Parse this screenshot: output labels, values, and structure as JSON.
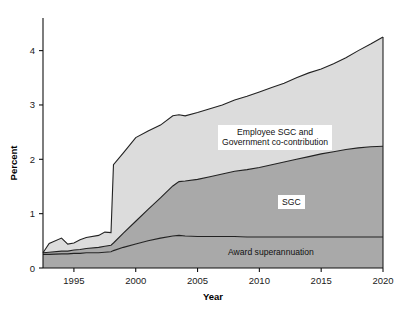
{
  "chart_data": {
    "type": "area",
    "title": "",
    "xlabel": "Year",
    "ylabel": "Percent",
    "xlim": [
      1992.5,
      2020
    ],
    "ylim": [
      0,
      4.6
    ],
    "xticks": [
      1995,
      2000,
      2005,
      2010,
      2015,
      2020
    ],
    "yticks": [
      0,
      1,
      2,
      3,
      4
    ],
    "xtick_labels": [
      "1995",
      "2000",
      "2005",
      "2010",
      "2015",
      "2020"
    ],
    "ytick_labels": [
      "0",
      "1",
      "2",
      "3",
      "4"
    ],
    "grid": false,
    "legend_position": "inline-annotations",
    "stacked": true,
    "x": [
      1992.5,
      1993,
      1994,
      1994.5,
      1995,
      1995.5,
      1996,
      1997,
      1997.5,
      1998,
      1998.2,
      1999,
      2000,
      2001,
      2002,
      2003,
      2003.5,
      2004,
      2005,
      2006,
      2007,
      2008,
      2009,
      2010,
      2011,
      2012,
      2013,
      2014,
      2015,
      2016,
      2017,
      2018,
      2019,
      2020
    ],
    "series": [
      {
        "name": "Award superannuation",
        "color": "#a9a9a9",
        "values": [
          0.25,
          0.25,
          0.26,
          0.26,
          0.27,
          0.27,
          0.28,
          0.28,
          0.29,
          0.3,
          0.32,
          0.38,
          0.44,
          0.5,
          0.55,
          0.59,
          0.6,
          0.59,
          0.58,
          0.58,
          0.58,
          0.58,
          0.57,
          0.57,
          0.57,
          0.57,
          0.57,
          0.57,
          0.57,
          0.57,
          0.57,
          0.57,
          0.57,
          0.57
        ]
      },
      {
        "name": "SGC",
        "color": "#a9a9a9",
        "values": [
          0.03,
          0.04,
          0.05,
          0.05,
          0.06,
          0.07,
          0.08,
          0.1,
          0.11,
          0.12,
          0.14,
          0.26,
          0.42,
          0.58,
          0.74,
          0.92,
          0.99,
          1.01,
          1.05,
          1.1,
          1.15,
          1.2,
          1.24,
          1.28,
          1.33,
          1.38,
          1.43,
          1.48,
          1.53,
          1.57,
          1.61,
          1.64,
          1.66,
          1.67
        ]
      },
      {
        "name": "Employee SGC and Government co-contribution",
        "color": "#dcdcdc",
        "values": [
          0.0,
          0.16,
          0.24,
          0.13,
          0.13,
          0.18,
          0.2,
          0.22,
          0.26,
          0.23,
          1.44,
          1.48,
          1.54,
          1.44,
          1.34,
          1.29,
          1.23,
          1.2,
          1.23,
          1.25,
          1.27,
          1.31,
          1.35,
          1.39,
          1.42,
          1.45,
          1.5,
          1.54,
          1.56,
          1.62,
          1.69,
          1.79,
          1.89,
          2.01
        ]
      }
    ],
    "cumulative_top_award": [
      0.25,
      0.25,
      0.26,
      0.26,
      0.27,
      0.27,
      0.28,
      0.28,
      0.29,
      0.3,
      0.32,
      0.38,
      0.44,
      0.5,
      0.55,
      0.59,
      0.6,
      0.59,
      0.58,
      0.58,
      0.58,
      0.58,
      0.57,
      0.57,
      0.57,
      0.57,
      0.57,
      0.57,
      0.57,
      0.57,
      0.57,
      0.57,
      0.57,
      0.57
    ],
    "cumulative_top_sgc": [
      0.28,
      0.29,
      0.31,
      0.31,
      0.33,
      0.34,
      0.36,
      0.38,
      0.4,
      0.42,
      0.46,
      0.64,
      0.86,
      1.08,
      1.29,
      1.51,
      1.59,
      1.6,
      1.63,
      1.68,
      1.73,
      1.78,
      1.81,
      1.85,
      1.9,
      1.95,
      2.0,
      2.05,
      2.1,
      2.14,
      2.18,
      2.21,
      2.23,
      2.24
    ],
    "cumulative_top_total": [
      0.28,
      0.45,
      0.55,
      0.44,
      0.46,
      0.52,
      0.56,
      0.6,
      0.66,
      0.65,
      1.9,
      2.12,
      2.4,
      2.52,
      2.63,
      2.8,
      2.82,
      2.8,
      2.86,
      2.93,
      3.0,
      3.09,
      3.16,
      3.24,
      3.32,
      3.4,
      3.5,
      3.59,
      3.66,
      3.76,
      3.87,
      4.0,
      4.12,
      4.25
    ],
    "annotations": [
      {
        "name": "employee-sgc-label",
        "text": "Employee SGC and\nGovernment co-contribution",
        "boxed": true,
        "x_px": 218,
        "y_px": 125
      },
      {
        "name": "sgc-label",
        "text": "SGC",
        "boxed": true,
        "x_px": 278,
        "y_px": 195
      },
      {
        "name": "award-superannuation-label",
        "text": "Award superannuation",
        "boxed": false,
        "x_px": 228,
        "y_px": 247
      }
    ]
  },
  "colors": {
    "band_light": "#dcdcdc",
    "band_dark": "#a9a9a9",
    "axis": "#111111",
    "outline": "#222222",
    "background": "#ffffff"
  }
}
